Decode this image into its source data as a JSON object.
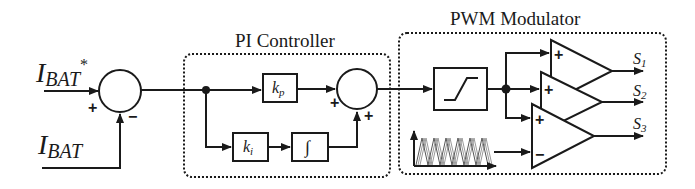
{
  "diagram": {
    "inputs": {
      "reference": {
        "symbol": "I",
        "subscript": "BAT",
        "superscript": "*"
      },
      "feedback": {
        "symbol": "I",
        "subscript": "BAT"
      }
    },
    "summing_junction_1": {
      "plus_sign": "+",
      "minus_sign": "−"
    },
    "pi_controller": {
      "label": "PI Controller",
      "proportional_gain": {
        "symbol": "k",
        "subscript": "p"
      },
      "integral_gain": {
        "symbol": "k",
        "subscript": "i"
      },
      "integrator": "∫",
      "sum_plus_1": "+",
      "sum_plus_2": "+"
    },
    "pwm_modulator": {
      "label": "PWM Modulator",
      "limiter": "saturation",
      "comparators": [
        {
          "plus": "+",
          "output": {
            "symbol": "S",
            "subscript": "1"
          }
        },
        {
          "plus": "+",
          "output": {
            "symbol": "S",
            "subscript": "2"
          }
        },
        {
          "plus": "+",
          "minus": "−",
          "output": {
            "symbol": "S",
            "subscript": "3"
          }
        }
      ],
      "carrier": "phase-shifted triangular carriers"
    }
  }
}
